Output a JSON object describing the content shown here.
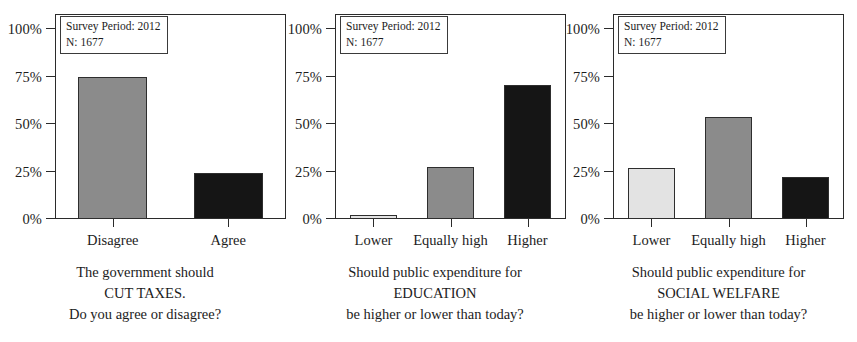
{
  "figure": {
    "background": "#ffffff",
    "axis_color": "#2b2b2b",
    "grid_color": "#d2d2d2"
  },
  "colors": {
    "light_gray": "#e3e3e3",
    "mid_gray": "#8b8b8b",
    "black": "#151515"
  },
  "axis": {
    "y_ticks": [
      "0%",
      "25%",
      "50%",
      "75%",
      "100%"
    ],
    "y_values": [
      0,
      25,
      50,
      75,
      100
    ],
    "ylim": [
      0,
      108
    ]
  },
  "annotation": {
    "line1": "Survey Period: 2012",
    "line2": "N: 1677"
  },
  "chart_data": [
    {
      "type": "bar",
      "title": "",
      "categories": [
        "Disagree",
        "Agree"
      ],
      "values": [
        75,
        24.5
      ],
      "bar_colors": [
        "#8b8b8b",
        "#151515"
      ],
      "xlabel": "",
      "ylabel": "",
      "ylim": [
        0,
        108
      ],
      "yticks": [
        0,
        25,
        50,
        75,
        100
      ],
      "ytick_labels": [
        "0%",
        "25%",
        "50%",
        "75%",
        "100%"
      ],
      "grid": true,
      "legend": "none",
      "annotation": [
        "Survey Period: 2012",
        "N: 1677"
      ],
      "caption": [
        "The government should",
        "CUT TAXES.",
        "Do you agree or disagree?"
      ]
    },
    {
      "type": "bar",
      "title": "",
      "categories": [
        "Lower",
        "Equally high",
        "Higher"
      ],
      "values": [
        2,
        27.5,
        70.5
      ],
      "bar_colors": [
        "#e3e3e3",
        "#8b8b8b",
        "#151515"
      ],
      "xlabel": "",
      "ylabel": "",
      "ylim": [
        0,
        108
      ],
      "yticks": [
        0,
        25,
        50,
        75,
        100
      ],
      "ytick_labels": [
        "0%",
        "25%",
        "50%",
        "75%",
        "100%"
      ],
      "grid": true,
      "legend": "none",
      "annotation": [
        "Survey Period: 2012",
        "N: 1677"
      ],
      "caption": [
        "Should public expenditure for",
        "EDUCATION",
        "be higher or lower than today?"
      ]
    },
    {
      "type": "bar",
      "title": "",
      "categories": [
        "Lower",
        "Equally high",
        "Higher"
      ],
      "values": [
        27,
        54,
        22
      ],
      "bar_colors": [
        "#e3e3e3",
        "#8b8b8b",
        "#151515"
      ],
      "xlabel": "",
      "ylabel": "",
      "ylim": [
        0,
        108
      ],
      "yticks": [
        0,
        25,
        50,
        75,
        100
      ],
      "ytick_labels": [
        "0%",
        "25%",
        "50%",
        "75%",
        "100%"
      ],
      "grid": true,
      "legend": "none",
      "annotation": [
        "Survey Period: 2012",
        "N: 1677"
      ],
      "caption": [
        "Should public expenditure for",
        "SOCIAL WELFARE",
        "be higher or lower than today?"
      ]
    }
  ]
}
